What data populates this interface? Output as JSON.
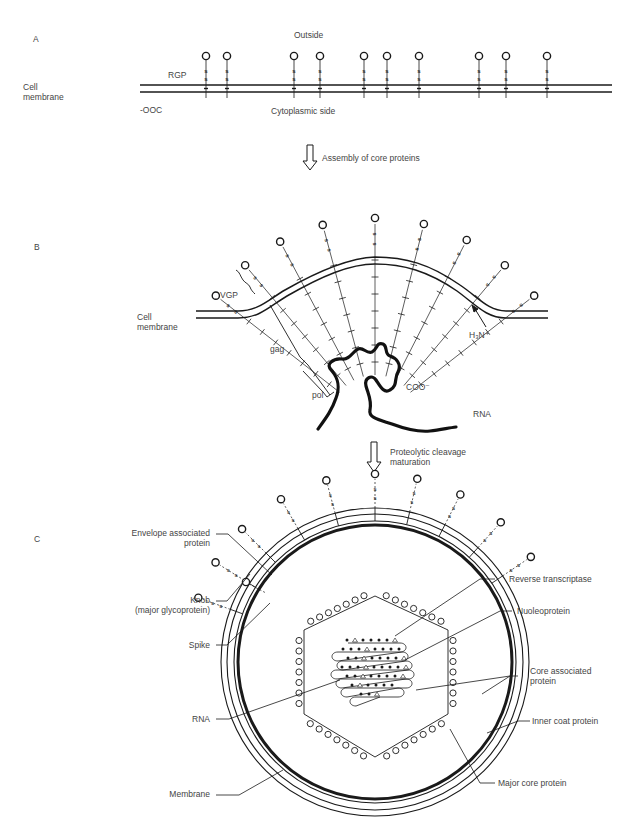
{
  "panels": {
    "a": {
      "letter": "A",
      "outside": "Outside",
      "rgp": "RGP",
      "cell_membrane_1": "Cell",
      "cell_membrane_2": "membrane",
      "cterm": "-OOC",
      "cytoplasmic": "Cytoplasmic side",
      "glycoprotein_x": [
        206,
        227,
        294,
        320,
        364,
        387,
        419,
        479,
        506,
        547
      ],
      "arrow_label": "Assembly of core proteins"
    },
    "b": {
      "letter": "B",
      "vgp": "VGP",
      "cell_membrane_1": "Cell",
      "cell_membrane_2": "membrane",
      "gag": "gag",
      "pol": "pol",
      "nterm": "H₃N⁺",
      "cterm": "COO⁻",
      "rna": "RNA",
      "arrow_label_1": "Proteolytic cleavage",
      "arrow_label_2": "maturation"
    },
    "c": {
      "letter": "C",
      "labels": {
        "envelope_1": "Envelope associated",
        "envelope_2": "protein",
        "knob_1": "Knob",
        "knob_2": "(major glycoprotein)",
        "spike": "Spike",
        "rna": "RNA",
        "membrane": "Membrane",
        "reverse_transcriptase": "Reverse transcriptase",
        "nucleoprotein": "Nuoleoprotein",
        "core_assoc_1": "Core associated",
        "core_assoc_2": "protein",
        "inner_coat": "Inner coat protein",
        "major_core": "Major core protein"
      }
    }
  },
  "colors": {
    "ink": "#1a1a1a",
    "text": "#444444",
    "background": "#ffffff"
  }
}
